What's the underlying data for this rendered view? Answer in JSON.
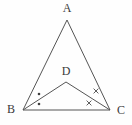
{
  "figure": {
    "type": "geometry-diagram",
    "shape": "triangle-with-cevians",
    "background_color": "#fefefe",
    "line_color": "#555555",
    "label_color": "#3a3a3a",
    "points": {
      "A": {
        "label": "A",
        "x": 67,
        "y": 20,
        "label_x": 67,
        "label_y": 9
      },
      "B": {
        "label": "B",
        "x": 23,
        "y": 110,
        "label_x": 11,
        "label_y": 110
      },
      "C": {
        "label": "C",
        "x": 110,
        "y": 110,
        "label_x": 121,
        "label_y": 111
      },
      "D": {
        "label": "D",
        "x": 66,
        "y": 82,
        "label_x": 66,
        "label_y": 72
      }
    },
    "segments": [
      {
        "name": "AB",
        "from": "A",
        "to": "B"
      },
      {
        "name": "AC",
        "from": "A",
        "to": "C"
      },
      {
        "name": "BC",
        "from": "B",
        "to": "C"
      },
      {
        "name": "BD",
        "from": "B",
        "to": "D"
      },
      {
        "name": "DC",
        "from": "D",
        "to": "C"
      }
    ],
    "angle_marks": {
      "B": {
        "symbol": "dot",
        "symbol_char": "•",
        "count": 2,
        "meaning": "angle ABD equals angle DBC",
        "positions": [
          {
            "x": 39,
            "y": 94
          },
          {
            "x": 39,
            "y": 104
          }
        ]
      },
      "C": {
        "symbol": "cross",
        "symbol_char": "×",
        "count": 2,
        "meaning": "angle ACD equals angle DCB",
        "positions": [
          {
            "x": 96,
            "y": 91
          },
          {
            "x": 89,
            "y": 103
          }
        ]
      }
    }
  }
}
